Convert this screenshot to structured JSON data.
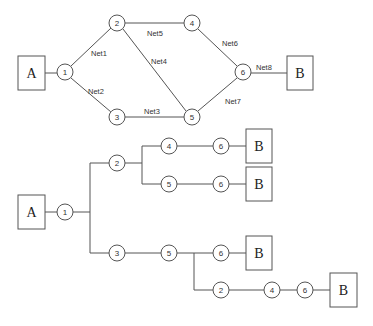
{
  "top_graph": {
    "source": "A",
    "target": "B",
    "nodes": [
      "1",
      "2",
      "3",
      "4",
      "5",
      "6"
    ],
    "edges": [
      {
        "from": "1",
        "to": "2",
        "label": "Net1"
      },
      {
        "from": "1",
        "to": "3",
        "label": "Net2"
      },
      {
        "from": "3",
        "to": "5",
        "label": "Net3"
      },
      {
        "from": "2",
        "to": "5",
        "label": "Net4"
      },
      {
        "from": "2",
        "to": "4",
        "label": "Net5"
      },
      {
        "from": "4",
        "to": "6",
        "label": "Net6"
      },
      {
        "from": "5",
        "to": "6",
        "label": "Net7"
      },
      {
        "from": "6",
        "to": "B",
        "label": "Net8"
      }
    ]
  },
  "path_tree": {
    "source": "A",
    "root": "1",
    "target": "B",
    "paths": [
      [
        "1",
        "2",
        "4",
        "6",
        "B"
      ],
      [
        "1",
        "2",
        "5",
        "6",
        "B"
      ],
      [
        "1",
        "3",
        "5",
        "6",
        "B"
      ],
      [
        "1",
        "3",
        "5",
        "2",
        "4",
        "6",
        "B"
      ]
    ],
    "labels": {
      "n1": "1",
      "n2a": "2",
      "n4a": "4",
      "n6a": "6",
      "n5b": "5",
      "n6b": "6",
      "n3": "3",
      "n5c": "5",
      "n6c": "6",
      "n2d": "2",
      "n4d": "4",
      "n6d": "6"
    }
  }
}
